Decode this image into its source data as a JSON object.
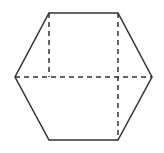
{
  "figure": {
    "type": "geometric-diagram",
    "shape_name": "hexagon",
    "canvas": {
      "width": 164,
      "height": 153,
      "background": "#ffffff"
    },
    "style": {
      "solid_stroke_color": "#333333",
      "dashed_stroke_color": "#333333",
      "solid_stroke_width": 1.5,
      "dashed_stroke_width": 1.5,
      "dash_pattern": "5,4",
      "fill": "none"
    },
    "vertices": [
      {
        "name": "top-left",
        "x": 49,
        "y": 13
      },
      {
        "name": "top-right",
        "x": 118,
        "y": 13
      },
      {
        "name": "right",
        "x": 152,
        "y": 77
      },
      {
        "name": "bottom-right",
        "x": 118,
        "y": 140
      },
      {
        "name": "bottom-left",
        "x": 49,
        "y": 140
      },
      {
        "name": "left",
        "x": 15,
        "y": 77
      }
    ],
    "outline_points": "49,13 118,13 152,77 118,140 49,140 15,77",
    "dashed_lines": [
      {
        "name": "horizontal-diagonal",
        "x1": 15,
        "y1": 77,
        "x2": 152,
        "y2": 77
      },
      {
        "name": "left-vertical-upper",
        "x1": 49,
        "y1": 13,
        "x2": 49,
        "y2": 77
      },
      {
        "name": "right-vertical-full",
        "x1": 118,
        "y1": 13,
        "x2": 118,
        "y2": 140
      }
    ]
  }
}
